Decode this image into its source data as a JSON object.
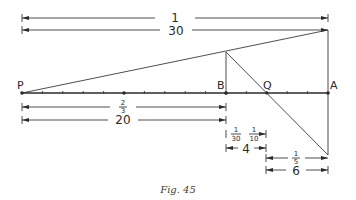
{
  "figure": {
    "caption": "Fig. 45",
    "points": {
      "P": {
        "label": "P",
        "pos": 0
      },
      "B": {
        "label": "B",
        "pos": 20
      },
      "Q": {
        "label": "Q",
        "pos": 24
      },
      "A": {
        "label": "A",
        "pos": 30
      }
    },
    "scale": {
      "length_units": 30,
      "major_every": 10,
      "minor_every": 2
    },
    "dimensions": {
      "top_ratio": {
        "label": "1"
      },
      "top_length": {
        "label": "30"
      },
      "pb_ratio": {
        "num": "2",
        "den": "3"
      },
      "pb_length": {
        "label": "20"
      },
      "bq_ratio_left": {
        "num": "1",
        "den": "30"
      },
      "bq_ratio_right": {
        "num": "1",
        "den": "10"
      },
      "bq_length": {
        "label": "4"
      },
      "qa_ratio": {
        "num": "1",
        "den": "5"
      },
      "qa_length": {
        "label": "6"
      }
    },
    "colors": {
      "ink": "#2a2a2a",
      "background": "#ffffff"
    }
  }
}
